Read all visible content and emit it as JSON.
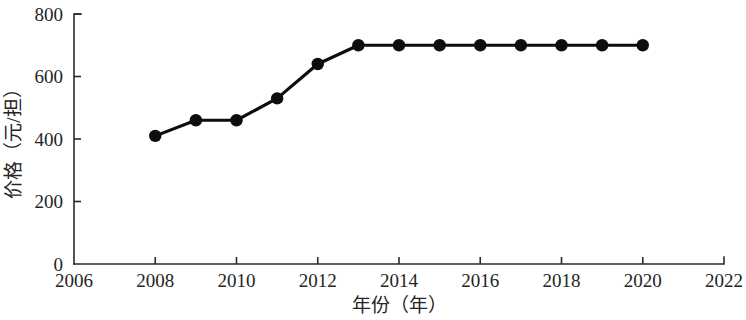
{
  "chart_data": {
    "type": "line",
    "title": "",
    "xlabel": "年份（年）",
    "ylabel": "价格（元/担）",
    "x": [
      2008,
      2009,
      2010,
      2011,
      2012,
      2013,
      2014,
      2015,
      2016,
      2017,
      2018,
      2019,
      2020
    ],
    "values": [
      410,
      460,
      460,
      530,
      640,
      700,
      700,
      700,
      700,
      700,
      700,
      700,
      700
    ],
    "series": [
      {
        "name": "价格",
        "values": [
          410,
          460,
          460,
          530,
          640,
          700,
          700,
          700,
          700,
          700,
          700,
          700,
          700
        ]
      }
    ],
    "xlim": [
      2006,
      2022
    ],
    "ylim": [
      0,
      800
    ],
    "xticks": [
      2006,
      2008,
      2010,
      2012,
      2014,
      2016,
      2018,
      2020,
      2022
    ],
    "xtick_labels": [
      "2006",
      "2008",
      "2010",
      "2012",
      "2014",
      "2016",
      "2018",
      "2020",
      "2022"
    ],
    "yticks": [
      0,
      200,
      400,
      600,
      800
    ],
    "ytick_labels": [
      "0",
      "200",
      "400",
      "600",
      "800"
    ],
    "grid": false,
    "legend": null,
    "marker": "filled-circle",
    "line_color": "#0d0d0d",
    "marker_color": "#0d0d0d",
    "axis_color": "#2b2b2b",
    "background_color": "#ffffff"
  }
}
